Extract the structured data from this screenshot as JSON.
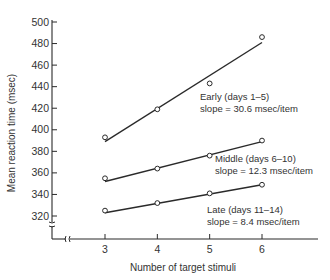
{
  "chart_data": {
    "type": "line",
    "title": "",
    "xlabel": "Number of target stimuli",
    "ylabel": "Mean reaction time (msec)",
    "x": [
      3,
      4,
      5,
      6
    ],
    "x_tick_labels": [
      "3",
      "4",
      "5",
      "6"
    ],
    "y_ticks": [
      320,
      340,
      360,
      380,
      400,
      420,
      440,
      460,
      480,
      500
    ],
    "y_tick_labels": [
      "320",
      "340",
      "360",
      "380",
      "400",
      "420",
      "440",
      "460",
      "480",
      "500"
    ],
    "ylim": [
      300,
      500
    ],
    "grid": false,
    "legend": "inline annotations",
    "axis_breaks": [
      "y-axis below 320",
      "x-axis between origin and 3"
    ],
    "series": [
      {
        "name": "Early (days 1-5)",
        "label_line1": "Early (days 1–5)",
        "label_line2": "slope = 30.6 msec/item",
        "slope": 30.6,
        "points": [
          393,
          419,
          443,
          486
        ],
        "fit": [
          389,
          420,
          450,
          481
        ]
      },
      {
        "name": "Middle (days 6-10)",
        "label_line1": "Middle (days 6–10)",
        "label_line2": "slope = 12.3 msec/item",
        "slope": 12.3,
        "points": [
          355,
          364,
          376,
          390
        ],
        "fit": [
          352,
          364,
          377,
          389
        ]
      },
      {
        "name": "Late (days 11-14)",
        "label_line1": "Late (days 11–14)",
        "label_line2": "slope = 8.4 msec/item",
        "slope": 8.4,
        "points": [
          325,
          332,
          341,
          349
        ],
        "fit": [
          323,
          332,
          340,
          349
        ]
      }
    ]
  },
  "colors": {
    "ink": "#2a2a2a",
    "background": "#ffffff"
  }
}
